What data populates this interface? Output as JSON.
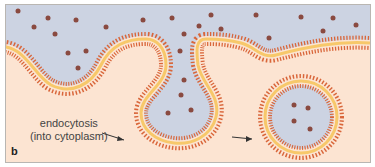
{
  "diagram": {
    "panel_letter": "b",
    "label_line1": "endocytosis",
    "label_line2": "(into cytoplasm)",
    "colors": {
      "extracellular": "#ccd3e2",
      "cytoplasm": "#fce4d2",
      "membrane_heads": "#d9663a",
      "membrane_core": "#f7c86a",
      "particle": "#8a4a40",
      "border": "#b9b6b2"
    }
  }
}
